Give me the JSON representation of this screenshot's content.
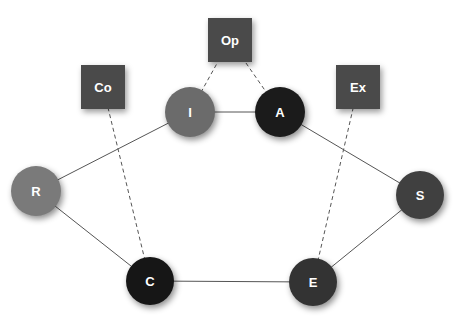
{
  "diagram": {
    "width": 469,
    "height": 320,
    "boxes": [
      {
        "id": "Op",
        "label": "Op",
        "cx": 230,
        "cy": 40,
        "size": 44,
        "color": "#4a4a4a"
      },
      {
        "id": "Co",
        "label": "Co",
        "cx": 103,
        "cy": 87,
        "size": 44,
        "color": "#4a4a4a"
      },
      {
        "id": "Ex",
        "label": "Ex",
        "cx": 358,
        "cy": 87,
        "size": 44,
        "color": "#4a4a4a"
      }
    ],
    "nodes": [
      {
        "id": "I",
        "label": "I",
        "cx": 190,
        "cy": 112,
        "r": 25,
        "color": "#6b6b6b"
      },
      {
        "id": "A",
        "label": "A",
        "cx": 280,
        "cy": 112,
        "r": 25,
        "color": "#1b1b1b"
      },
      {
        "id": "R",
        "label": "R",
        "cx": 36,
        "cy": 191,
        "r": 25,
        "color": "#7a7a7a"
      },
      {
        "id": "S",
        "label": "S",
        "cx": 420,
        "cy": 195,
        "r": 24,
        "color": "#404040"
      },
      {
        "id": "C",
        "label": "C",
        "cx": 150,
        "cy": 281,
        "r": 24,
        "color": "#161616"
      },
      {
        "id": "E",
        "label": "E",
        "cx": 313,
        "cy": 282,
        "r": 24,
        "color": "#333333"
      }
    ],
    "edges": [
      {
        "from": "I",
        "to": "A",
        "style": "solid"
      },
      {
        "from": "I",
        "to": "R",
        "style": "solid"
      },
      {
        "from": "R",
        "to": "C",
        "style": "solid"
      },
      {
        "from": "C",
        "to": "E",
        "style": "solid"
      },
      {
        "from": "E",
        "to": "S",
        "style": "solid"
      },
      {
        "from": "S",
        "to": "A",
        "style": "solid"
      },
      {
        "from": "Op",
        "to": "I",
        "style": "dashed"
      },
      {
        "from": "Op",
        "to": "A",
        "style": "dashed"
      },
      {
        "from": "Co",
        "to": "C",
        "style": "dashed"
      },
      {
        "from": "Ex",
        "to": "E",
        "style": "dashed"
      }
    ],
    "edge_color": "#555555"
  }
}
